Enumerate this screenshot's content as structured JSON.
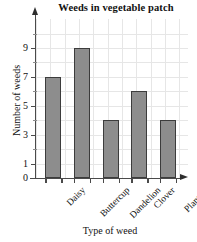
{
  "chart_data": {
    "type": "bar",
    "title": "Weeds in vegetable patch",
    "xlabel": "Type of weed",
    "ylabel": "Number of weeds",
    "categories": [
      "Daisy",
      "Buttercup",
      "Dandelion",
      "Clover",
      "Plantain"
    ],
    "values": [
      7,
      9,
      4,
      6,
      4
    ],
    "ylim": [
      0,
      10
    ],
    "ytick_labels": [
      "0",
      "1",
      "3",
      "5",
      "7",
      "9"
    ],
    "ytick_values": [
      0,
      1,
      3,
      5,
      7,
      9
    ],
    "yminor_values": [
      2,
      4,
      6,
      8,
      10
    ],
    "grid": true,
    "legend": "none",
    "bar_color": "#8d8d8d",
    "bar_border_color": "#3c3c3c",
    "grid_color": "#e6e6e6",
    "axis_color": "#4a4a4a",
    "background": "#ffffff"
  },
  "axis": {
    "y_arrow": "up-arrow-icon",
    "x_arrow": "right-arrow-icon"
  }
}
